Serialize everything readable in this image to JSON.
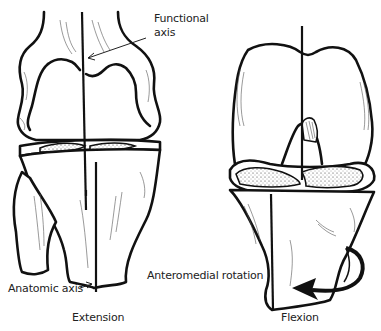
{
  "figure": {
    "panels": [
      {
        "id": "extension",
        "caption": "Extension",
        "labels": {
          "functional_axis": [
            "Functional",
            "axis"
          ],
          "anatomic_axis": "Anatomic axis"
        }
      },
      {
        "id": "flexion",
        "caption": "Flexion",
        "labels": {
          "rotation": "Anteromedial rotation"
        }
      }
    ],
    "colors": {
      "line": "#111111",
      "background": "#ffffff"
    }
  }
}
